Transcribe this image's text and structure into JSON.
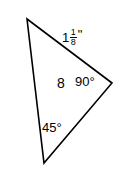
{
  "figure": {
    "canvas": {
      "width": 125,
      "height": 179,
      "background": "#ffffff"
    },
    "stroke_color": "#000000",
    "text_color": "#000000",
    "shape": {
      "name": "triangle",
      "vertices": [
        {
          "name": "top-vertex",
          "x": 27,
          "y": 19
        },
        {
          "name": "right-vertex",
          "x": 112,
          "y": 83
        },
        {
          "name": "bottom-vertex",
          "x": 44,
          "y": 163
        }
      ]
    },
    "labels": {
      "side_mixed": {
        "whole": "1",
        "numerator": "1",
        "denominator": "8",
        "unit": "\"",
        "full_text": "1 1/8\""
      },
      "side_8": "8",
      "angle_right": "90°",
      "angle_bottom": "45°"
    }
  }
}
